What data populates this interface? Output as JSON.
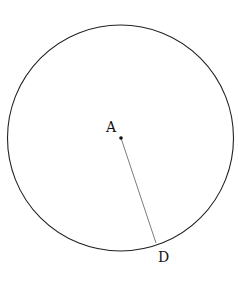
{
  "figure": {
    "circle": {
      "cx": 120.5,
      "cy": 138,
      "r": 113,
      "stroke": "#222222"
    },
    "points": [
      {
        "id": "A",
        "label": "A",
        "x": 121,
        "y": 138,
        "label_x": 106,
        "label_y": 132
      },
      {
        "id": "D",
        "label": "D",
        "x": 156,
        "y": 243,
        "label_x": 158,
        "label_y": 262
      }
    ],
    "segments": [
      {
        "from": "A",
        "to": "D",
        "stroke": "#444444"
      }
    ]
  }
}
